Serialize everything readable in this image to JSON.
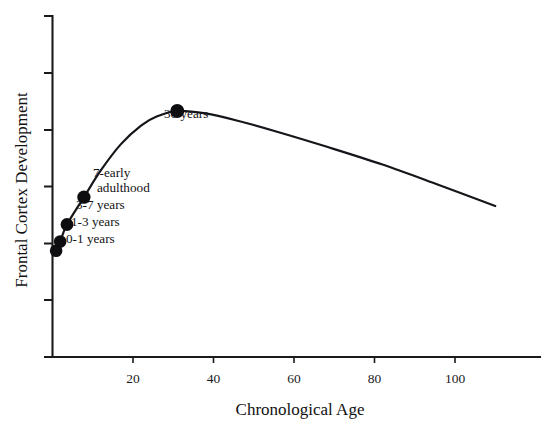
{
  "chart_data": {
    "type": "line",
    "title": "",
    "subtitle": "",
    "xlabel": "Chronological Age",
    "ylabel": "Frontal Cortex Development",
    "xlim": [
      0,
      115
    ],
    "ylim": [
      0,
      7
    ],
    "grid": false,
    "legend": false,
    "legend_position": "none",
    "x_ticks": [
      {
        "value": 20,
        "label": "20"
      },
      {
        "value": 40,
        "label": "40"
      },
      {
        "value": 60,
        "label": "60"
      },
      {
        "value": 80,
        "label": "80"
      },
      {
        "value": 100,
        "label": "100"
      }
    ],
    "y_ticks": [
      {
        "value": 6,
        "label": ""
      },
      {
        "value": 5,
        "label": ""
      },
      {
        "value": 4,
        "label": ""
      },
      {
        "value": 3,
        "label": ""
      },
      {
        "value": 2,
        "label": ""
      },
      {
        "value": 1,
        "label": ""
      },
      {
        "value": 0,
        "label": ""
      }
    ],
    "series": [
      {
        "name": "Frontal cortex development trajectory",
        "x": [
          0.9,
          1.9,
          3.6,
          7.8,
          12,
          17,
          22,
          26,
          31,
          38,
          46,
          56,
          68,
          82,
          96,
          110
        ],
        "y": [
          2.18,
          2.37,
          2.72,
          3.28,
          3.83,
          4.37,
          4.75,
          4.94,
          5.05,
          5.0,
          4.85,
          4.62,
          4.32,
          3.95,
          3.53,
          3.1
        ]
      }
    ],
    "annotated_points": [
      {
        "id": "pt-0-1-years",
        "label": "0-1 years",
        "x": 0.9,
        "y": 2.18,
        "label_lines": [
          "0-1 years"
        ]
      },
      {
        "id": "pt-1-3-years",
        "label": "1-3 years",
        "x": 1.9,
        "y": 2.37,
        "label_lines": [
          "1-3 years"
        ]
      },
      {
        "id": "pt-3-7-years",
        "label": "3-7 years",
        "x": 3.6,
        "y": 2.72,
        "label_lines": [
          "3-7 years"
        ]
      },
      {
        "id": "pt-7-early-adulthood",
        "label": "7-early adulthood",
        "x": 7.8,
        "y": 3.28,
        "label_lines": [
          "7-early",
          "adulthood"
        ]
      },
      {
        "id": "pt-30-years",
        "label": "30 years",
        "x": 31,
        "y": 5.05,
        "label_lines": [
          "30 years"
        ]
      }
    ],
    "colors": {
      "curve": "#15161a",
      "marker": "#0d0d10",
      "axis": "#1a1a1a",
      "text": "#111111",
      "background": "#ffffff"
    }
  }
}
